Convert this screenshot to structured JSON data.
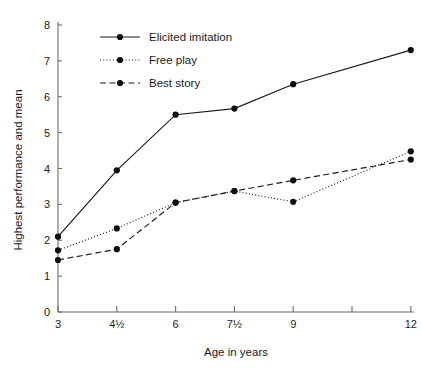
{
  "chart_data": {
    "type": "line",
    "title": "",
    "xlabel": "Age in years",
    "ylabel": "Highest performance and mean",
    "x": [
      "3",
      "4½",
      "6",
      "7½",
      "9",
      "12"
    ],
    "x_numeric": [
      3,
      4.5,
      6,
      7.5,
      9,
      12
    ],
    "xtick_labels": [
      "3",
      "4½",
      "6",
      "7½",
      "9",
      "",
      "12"
    ],
    "xtick_positions": [
      3,
      4.5,
      6,
      7.5,
      9,
      10.5,
      12
    ],
    "ytick_labels": [
      "0",
      "1",
      "2",
      "3",
      "4",
      "5",
      "6",
      "7",
      "8"
    ],
    "ylim": [
      0,
      8
    ],
    "grid": false,
    "legend_position": "top-left",
    "series": [
      {
        "name": "Elicited imitation",
        "style": "solid",
        "marker": "filled-circle",
        "color": "#1a1a1a",
        "values": [
          2.1,
          3.95,
          5.5,
          5.67,
          6.35,
          7.3
        ]
      },
      {
        "name": "Free play",
        "style": "dotted",
        "marker": "filled-circle",
        "color": "#1a1a1a",
        "values": [
          1.72,
          2.33,
          3.05,
          3.37,
          3.07,
          4.48
        ]
      },
      {
        "name": "Best story",
        "style": "dashed",
        "marker": "filled-circle",
        "color": "#1a1a1a",
        "values": [
          1.45,
          1.75,
          3.05,
          3.37,
          3.67,
          4.25
        ]
      }
    ]
  },
  "legend": {
    "items": [
      {
        "label": "Elicited imitation",
        "style": "solid"
      },
      {
        "label": "Free play",
        "style": "dotted"
      },
      {
        "label": "Best story",
        "style": "dashed"
      }
    ]
  },
  "axes": {
    "x_title": "Age in years",
    "y_title": "Highest performance and mean"
  }
}
